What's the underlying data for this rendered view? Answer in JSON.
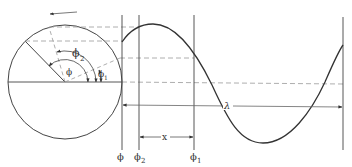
{
  "figure": {
    "rotation_arrow": "counter-clockwise",
    "colors": {
      "line": "#444444",
      "dashed": "#999999",
      "background": "#ffffff"
    }
  },
  "labels": {
    "angle_phi": "ϕ",
    "angle_phi2": "ϕ",
    "angle_phi2_sub": "2",
    "angle_phi1": "ϕ",
    "angle_phi1_sub": "1",
    "wavelength": "λ",
    "distance": "x",
    "axis_phi": "ϕ",
    "axis_phi2": "ϕ",
    "axis_phi2_sub": "2",
    "axis_phi1": "ϕ",
    "axis_phi1_sub": "1"
  }
}
